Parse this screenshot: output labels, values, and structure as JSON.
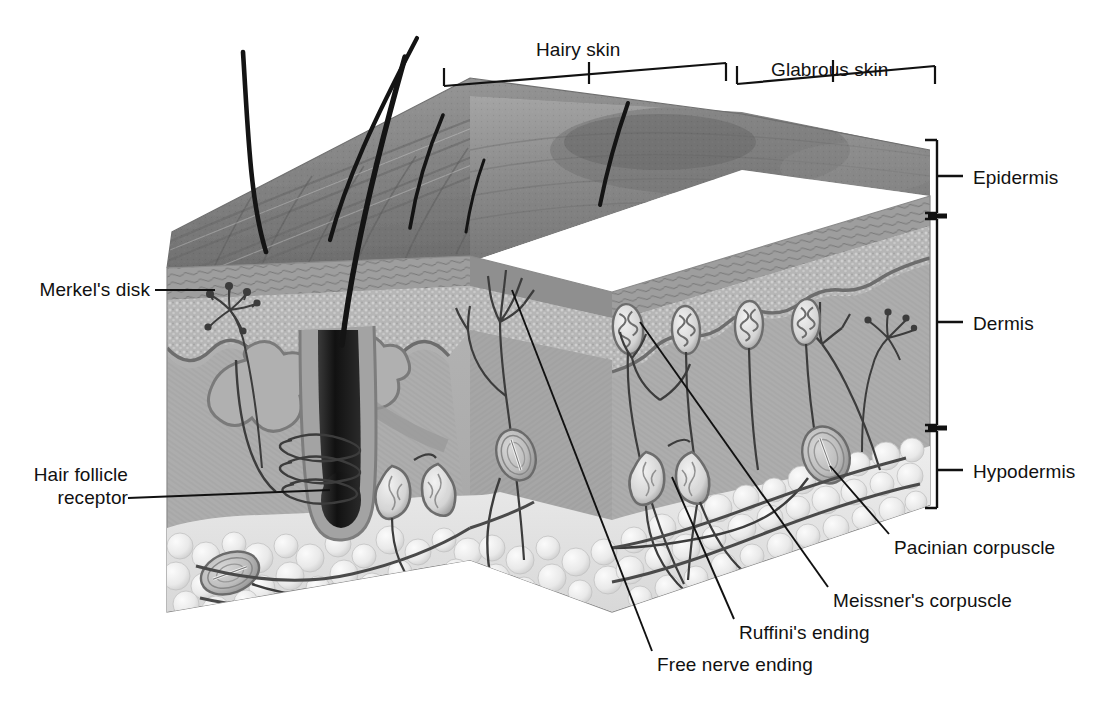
{
  "figure": {
    "type": "anatomical cross-section diagram",
    "style": "grayscale airbrush illustration with leader-line labels"
  },
  "top_brackets": [
    {
      "id": "hairy-skin",
      "label": "Hairy skin",
      "label_x": 536,
      "label_y": 38,
      "tick_x": 589,
      "tick_y0": 62,
      "tick_y1": 84,
      "span_x0": 444,
      "span_y0": 86,
      "span_x1": 726,
      "span_y1": 63,
      "cap": 18
    },
    {
      "id": "glabrous-skin",
      "label": "Glabrous skin",
      "label_x": 771,
      "label_y": 58,
      "tick_x": 833,
      "tick_y0": 82,
      "tick_y1": 104,
      "span_x0": 737,
      "span_y0": 84,
      "span_x1": 935,
      "span_y1": 66,
      "cap": 18
    }
  ],
  "right_brackets": [
    {
      "id": "epidermis",
      "label": "Epidermis",
      "x": 937,
      "y0": 140,
      "y1": 213,
      "tick_y": 176,
      "label_x": 973,
      "label_y": 166
    },
    {
      "id": "dermis",
      "label": "Dermis",
      "x": 937,
      "y0": 219,
      "y1": 425,
      "tick_y": 322,
      "label_x": 973,
      "label_y": 312
    },
    {
      "id": "hypodermis",
      "label": "Hypodermis",
      "x": 937,
      "y0": 431,
      "y1": 508,
      "tick_y": 470,
      "label_x": 973,
      "label_y": 460
    }
  ],
  "labels": [
    {
      "id": "merkels-disk",
      "text": "Merkel's disk",
      "align": "right",
      "x": 25,
      "y": 278,
      "w": 125,
      "leader": [
        [
          155,
          290
        ],
        [
          215,
          290
        ]
      ]
    },
    {
      "id": "hair-follicle-receptor",
      "text": "Hair follicle\nreceptor",
      "align": "right",
      "x": 20,
      "y": 463,
      "w": 130,
      "leader": [
        [
          128,
          498
        ],
        [
          330,
          490
        ]
      ]
    },
    {
      "id": "pacinian-corpuscle",
      "text": "Pacinian corpuscle",
      "align": "left",
      "x": 894,
      "y": 536,
      "w": 185,
      "leader": [
        [
          889,
          534
        ],
        [
          830,
          466
        ]
      ]
    },
    {
      "id": "meissners-corpuscle",
      "text": "Meissner's corpuscle",
      "align": "left",
      "x": 833,
      "y": 589,
      "w": 200,
      "leader": [
        [
          828,
          587
        ],
        [
          640,
          322
        ]
      ]
    },
    {
      "id": "ruffinis-ending",
      "text": "Ruffini's ending",
      "align": "left",
      "x": 739,
      "y": 621,
      "w": 155,
      "leader": [
        [
          734,
          619
        ],
        [
          672,
          477
        ]
      ]
    },
    {
      "id": "free-nerve-ending",
      "text": "Free nerve ending",
      "align": "left",
      "x": 657,
      "y": 653,
      "w": 180,
      "leader": [
        [
          652,
          651
        ],
        [
          512,
          290
        ]
      ]
    }
  ],
  "structures": {
    "hairs": [
      {
        "id": "hair-1",
        "path": "M266,252 C250,200 248,130 243,52"
      },
      {
        "id": "hair-2",
        "path": "M330,240 C346,180 374,120 417,38"
      },
      {
        "id": "hair-3",
        "path": "M342,345 C352,260 376,160 405,57"
      },
      {
        "id": "hair-4",
        "path": "M410,228 C416,190 428,150 443,115"
      },
      {
        "id": "hair-5",
        "path": "M600,205 C606,175 615,140 628,103"
      }
    ],
    "meissner_corpuscles": [
      {
        "cx": 628,
        "cy": 329,
        "rx": 15,
        "ry": 25,
        "rot": -6
      },
      {
        "cx": 686,
        "cy": 330,
        "rx": 14,
        "ry": 24,
        "rot": -3
      },
      {
        "cx": 749,
        "cy": 325,
        "rx": 14,
        "ry": 24,
        "rot": 2
      },
      {
        "cx": 806,
        "cy": 322,
        "rx": 14,
        "ry": 23,
        "rot": 4
      }
    ],
    "pacinian_corpuscles": [
      {
        "cx": 826,
        "cy": 455,
        "rx": 23,
        "ry": 29,
        "rot": -20
      },
      {
        "cx": 516,
        "cy": 455,
        "rx": 19,
        "ry": 26,
        "rot": -18
      },
      {
        "cx": 230,
        "cy": 573,
        "rx": 26,
        "ry": 18,
        "rot": -18
      }
    ],
    "ruffini_endings": [
      {
        "cx": 646,
        "cy": 478,
        "rx": 17,
        "ry": 23,
        "rot": 25
      },
      {
        "cx": 686,
        "cy": 480,
        "rx": 16,
        "ry": 23,
        "rot": -18
      },
      {
        "cx": 392,
        "cy": 490,
        "rx": 17,
        "ry": 22,
        "rot": 28
      },
      {
        "cx": 430,
        "cy": 487,
        "rx": 16,
        "ry": 22,
        "rot": -20
      }
    ],
    "hair_follicle": {
      "x": 300,
      "y": 330,
      "bulb_cy": 505
    },
    "layer_colors": {
      "epidermis_surface": "#8e8e8e",
      "epidermis_body": "#b9b9b9",
      "dermis": "#ababab",
      "dermis_light": "#c2c2c2",
      "hypodermis_fat": "#e8e8e8",
      "outline": "#4a4a4a",
      "label_text": "#111111"
    }
  }
}
